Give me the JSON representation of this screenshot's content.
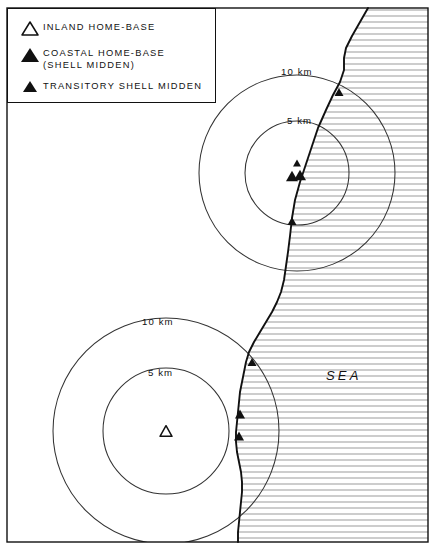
{
  "figure": {
    "type": "archaeological-site-catchment-map",
    "frame": {
      "x": 7,
      "y": 8,
      "width": 421,
      "height": 534
    }
  },
  "legend": {
    "box": {
      "x": 7,
      "y": 8,
      "width": 209,
      "height": 95
    },
    "items": [
      {
        "glyph": "open-triangle",
        "label_line1": "INLAND HOME-BASE",
        "label_line2": ""
      },
      {
        "glyph": "filled-triangle-large",
        "label_line1": "COASTAL HOME-BASE",
        "label_line2": "(SHELL MIDDEN)"
      },
      {
        "glyph": "filled-triangle-small",
        "label_line1": "TRANSITORY SHELL MIDDEN",
        "label_line2": ""
      }
    ]
  },
  "sea": {
    "label": "SEA",
    "label_pos": {
      "x": 326,
      "y": 368
    },
    "hatch_spacing_px": 6,
    "hatch_color": "#8a8a8a"
  },
  "catchments": [
    {
      "name": "coastal-home-base-catchment",
      "center": {
        "x": 297,
        "y": 173
      },
      "rings": [
        {
          "radius_km": 10,
          "radius_px": 98,
          "label": "10 km",
          "label_pos": {
            "x": 281,
            "y": 66
          }
        },
        {
          "radius_km": 5,
          "radius_px": 52,
          "label": "5 km",
          "label_pos": {
            "x": 287,
            "y": 115
          }
        }
      ]
    },
    {
      "name": "inland-home-base-catchment",
      "center": {
        "x": 166,
        "y": 431
      },
      "rings": [
        {
          "radius_km": 10,
          "radius_px": 113,
          "label": "10 km",
          "label_pos": {
            "x": 142,
            "y": 316
          }
        },
        {
          "radius_km": 5,
          "radius_px": 63,
          "label": "5 km",
          "label_pos": {
            "x": 148,
            "y": 367
          }
        }
      ]
    }
  ],
  "sites": [
    {
      "type": "transitory-shell-midden",
      "x": 339,
      "y": 92,
      "size": 9
    },
    {
      "type": "transitory-shell-midden",
      "x": 297,
      "y": 163,
      "size": 8
    },
    {
      "type": "coastal-home-base",
      "x": 292,
      "y": 176,
      "size": 12
    },
    {
      "type": "coastal-home-base",
      "x": 300,
      "y": 175,
      "size": 12
    },
    {
      "type": "transitory-shell-midden",
      "x": 292,
      "y": 221,
      "size": 9
    },
    {
      "type": "transitory-shell-midden",
      "x": 252,
      "y": 362,
      "size": 9
    },
    {
      "type": "transitory-shell-midden",
      "x": 240,
      "y": 414,
      "size": 10
    },
    {
      "type": "transitory-shell-midden",
      "x": 239,
      "y": 436,
      "size": 10
    },
    {
      "type": "inland-home-base",
      "x": 166,
      "y": 431,
      "size": 12
    }
  ],
  "coastline": {
    "name": "coastline",
    "points": "368,8 360,22 352,36 346,48 344,58 344,70 340,82 333,95 326,110 318,128 312,146 306,164 300,182 295,200 292,218 290,236 288,252 286,266 284,280 281,292 277,302 272,312 266,322 260,332 254,342 249,352 246,362 244,372 242,382 240,392 239,402 238,412 237,422 236,432 236,442 237,452 239,462 241,472 242,482 242,492 241,502 240,512 239,522 238,532 238,542"
  },
  "colors": {
    "ink": "#111111",
    "circle_stroke": "#333333",
    "hatch": "#8a8a8a",
    "background": "#ffffff"
  }
}
